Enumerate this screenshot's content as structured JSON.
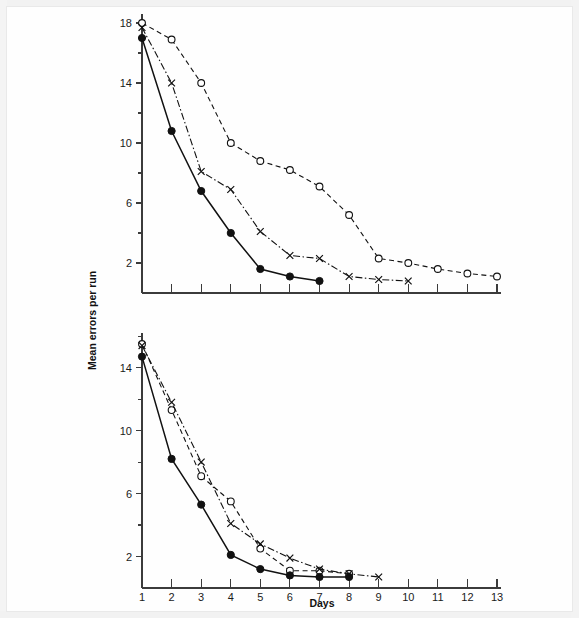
{
  "figure": {
    "title": "",
    "y_axis_label": "Mean errors per run",
    "x_axis_label": "Days",
    "background_color": "#ffffff",
    "ink_color": "#111111"
  },
  "chart_data": [
    {
      "type": "line",
      "id": "upper-panel",
      "title": "",
      "xlabel": "",
      "ylabel": "Mean errors per run",
      "xlim": [
        1,
        13
      ],
      "ylim": [
        0,
        18.6
      ],
      "xticks": [
        1,
        2,
        3,
        4,
        5,
        6,
        7,
        8,
        9,
        10,
        11,
        12,
        13
      ],
      "xticklabels": [
        "",
        "",
        "",
        "",
        "",
        "",
        "",
        "",
        "",
        "",
        "",
        "",
        ""
      ],
      "yticks": [
        2,
        4,
        6,
        8,
        10,
        12,
        14,
        16,
        18
      ],
      "yticklabels": [
        "2",
        "",
        "6",
        "",
        "10",
        "",
        "14",
        "",
        "18"
      ],
      "grid": false,
      "legend": "none",
      "series": [
        {
          "name": "open-circle-group",
          "marker": "open-circle",
          "linestyle": "dashed",
          "x": [
            1,
            2,
            3,
            4,
            5,
            6,
            7,
            8,
            9,
            10,
            11,
            12,
            13
          ],
          "values": [
            18.0,
            16.9,
            14.0,
            10.0,
            8.8,
            8.2,
            7.1,
            5.2,
            2.3,
            2.0,
            1.6,
            1.3,
            1.1
          ]
        },
        {
          "name": "cross-group",
          "marker": "cross",
          "linestyle": "dash-dot",
          "x": [
            1,
            2,
            3,
            4,
            5,
            6,
            7,
            8,
            9,
            10
          ],
          "values": [
            17.7,
            14.0,
            8.1,
            6.9,
            4.1,
            2.5,
            2.3,
            1.1,
            0.9,
            0.8
          ]
        },
        {
          "name": "filled-circle-group",
          "marker": "filled-circle",
          "linestyle": "solid",
          "x": [
            1,
            2,
            3,
            4,
            5,
            6,
            7
          ],
          "values": [
            17.0,
            10.8,
            6.8,
            4.0,
            1.6,
            1.1,
            0.8
          ]
        }
      ]
    },
    {
      "type": "line",
      "id": "lower-panel",
      "title": "",
      "xlabel": "Days",
      "ylabel": "",
      "xlim": [
        1,
        13
      ],
      "ylim": [
        0,
        16.2
      ],
      "xticks": [
        1,
        2,
        3,
        4,
        5,
        6,
        7,
        8,
        9,
        10,
        11,
        12,
        13
      ],
      "xticklabels": [
        "1",
        "2",
        "3",
        "4",
        "5",
        "6",
        "7",
        "8",
        "9",
        "10",
        "11",
        "12",
        "13"
      ],
      "yticks": [
        2,
        4,
        6,
        8,
        10,
        12,
        14,
        16
      ],
      "yticklabels": [
        "2",
        "",
        "6",
        "",
        "10",
        "",
        "14",
        ""
      ],
      "grid": false,
      "legend": "none",
      "series": [
        {
          "name": "open-circle-group",
          "marker": "open-circle",
          "linestyle": "dashed",
          "x": [
            1,
            2,
            3,
            4,
            5,
            6,
            7,
            8
          ],
          "values": [
            15.5,
            11.3,
            7.1,
            5.5,
            2.5,
            1.1,
            1.1,
            0.9
          ]
        },
        {
          "name": "cross-group",
          "marker": "cross",
          "linestyle": "dash-dot",
          "x": [
            1,
            2,
            3,
            4,
            5,
            6,
            7,
            8,
            9
          ],
          "values": [
            15.4,
            11.8,
            8.0,
            4.1,
            2.8,
            1.9,
            1.2,
            0.9,
            0.7
          ]
        },
        {
          "name": "filled-circle-group",
          "marker": "filled-circle",
          "linestyle": "solid",
          "x": [
            1,
            2,
            3,
            4,
            5,
            6,
            7,
            8
          ],
          "values": [
            14.7,
            8.2,
            5.3,
            2.1,
            1.2,
            0.8,
            0.7,
            0.7
          ]
        }
      ]
    }
  ],
  "geometry": {
    "upper": {
      "left": 142,
      "right": 497,
      "top": 14,
      "bottom": 293,
      "y_value_top": 18.6,
      "y_value_bottom": 0
    },
    "lower": {
      "left": 142,
      "right": 497,
      "top": 333,
      "bottom": 588,
      "y_value_top": 16.2,
      "y_value_bottom": 0
    }
  }
}
